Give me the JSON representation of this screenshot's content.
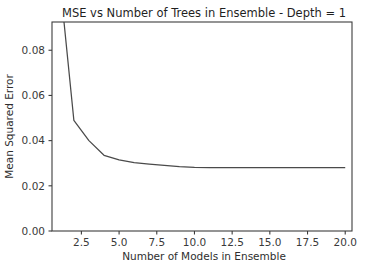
{
  "figure": {
    "background_color": "#ffffff",
    "plot_background_color": "#ffffff",
    "axis_color": "#3c3c3c",
    "line_color": "#4a4a4a"
  },
  "chart_data": {
    "type": "line",
    "title": "MSE vs Number of Trees in Ensemble - Depth = 1",
    "xlabel": "Number of Models in Ensemble",
    "ylabel": "Mean Squared Error",
    "xlim": [
      0.55,
      20.45
    ],
    "ylim": [
      0.0,
      0.0925
    ],
    "grid": false,
    "legend": null,
    "xticks": [
      2.5,
      5.0,
      7.5,
      10.0,
      12.5,
      15.0,
      17.5,
      20.0
    ],
    "xtick_labels": [
      "2.5",
      "5.0",
      "7.5",
      "10.0",
      "12.5",
      "15.0",
      "17.5",
      "20.0"
    ],
    "yticks": [
      0.0,
      0.02,
      0.04,
      0.06,
      0.08
    ],
    "ytick_labels": [
      "0.00",
      "0.02",
      "0.04",
      "0.06",
      "0.08"
    ],
    "note": "Series starts above the visible y-range at x=1 and is clipped by the top spine",
    "series": [
      {
        "name": "MSE",
        "x": [
          1,
          2,
          3,
          4,
          5,
          6,
          7,
          8,
          9,
          10,
          11,
          12,
          13,
          14,
          15,
          16,
          17,
          18,
          19,
          20
        ],
        "values": [
          0.1155,
          0.049,
          0.04,
          0.0335,
          0.0315,
          0.0303,
          0.0296,
          0.029,
          0.0285,
          0.0282,
          0.0281,
          0.0281,
          0.0281,
          0.0281,
          0.0281,
          0.0281,
          0.0281,
          0.0281,
          0.0281,
          0.0281
        ]
      }
    ]
  }
}
